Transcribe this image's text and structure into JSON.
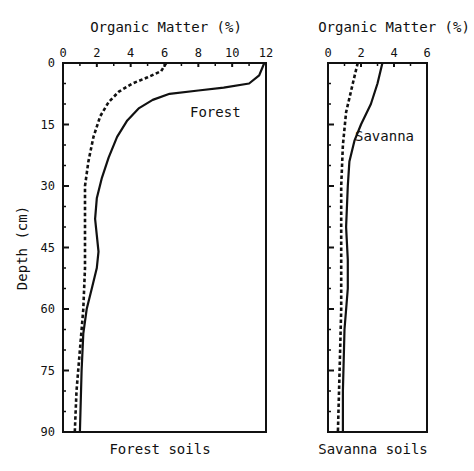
{
  "chart_data": [
    {
      "type": "line",
      "panel": "forest",
      "title": "Organic Matter (%)",
      "caption": "Forest soils",
      "xlabel": "Organic Matter (%)",
      "ylabel": "Depth (cm)",
      "xlim": [
        0,
        12
      ],
      "ylim": [
        0,
        90
      ],
      "y_inverted": true,
      "x_ticks": [
        0,
        2,
        4,
        6,
        8,
        10,
        12
      ],
      "y_ticks": [
        0,
        15,
        30,
        45,
        60,
        75,
        90
      ],
      "grid": false,
      "annotations": [
        {
          "text": "Forest",
          "x": 7.5,
          "y": 13
        }
      ],
      "series": [
        {
          "name": "Forest (solid)",
          "style": "solid",
          "points": [
            [
              11.9,
              0
            ],
            [
              11.6,
              3
            ],
            [
              11.0,
              5
            ],
            [
              9.5,
              6
            ],
            [
              8.0,
              6.7
            ],
            [
              6.3,
              7.5
            ],
            [
              5.3,
              9
            ],
            [
              4.5,
              11
            ],
            [
              3.8,
              14
            ],
            [
              3.2,
              18
            ],
            [
              2.7,
              23
            ],
            [
              2.3,
              28
            ],
            [
              2.0,
              33
            ],
            [
              1.9,
              38
            ],
            [
              2.0,
              42
            ],
            [
              2.1,
              46
            ],
            [
              2.0,
              50
            ],
            [
              1.7,
              55
            ],
            [
              1.4,
              60
            ],
            [
              1.2,
              66
            ],
            [
              1.1,
              75
            ],
            [
              1.0,
              90
            ]
          ]
        },
        {
          "name": "Forest comparison (dashed)",
          "style": "dashed",
          "points": [
            [
              6.1,
              0
            ],
            [
              5.8,
              2
            ],
            [
              5.0,
              3.5
            ],
            [
              4.1,
              5
            ],
            [
              3.3,
              7
            ],
            [
              2.7,
              9.5
            ],
            [
              2.2,
              13
            ],
            [
              1.8,
              18
            ],
            [
              1.5,
              24
            ],
            [
              1.3,
              30
            ],
            [
              1.3,
              40
            ],
            [
              1.3,
              50
            ],
            [
              1.2,
              60
            ],
            [
              1.0,
              70
            ],
            [
              0.8,
              80
            ],
            [
              0.7,
              90
            ]
          ]
        }
      ]
    },
    {
      "type": "line",
      "panel": "savanna",
      "title": "Organic Matter (%)",
      "caption": "Savanna soils",
      "xlabel": "Organic Matter (%)",
      "ylabel": "Depth (cm)",
      "xlim": [
        0,
        6
      ],
      "ylim": [
        0,
        90
      ],
      "y_inverted": true,
      "x_ticks": [
        0,
        2,
        4,
        6
      ],
      "y_ticks": [
        0,
        15,
        30,
        45,
        60,
        75,
        90
      ],
      "grid": false,
      "annotations": [
        {
          "text": "Savanna",
          "x": 2.8,
          "y": 18
        }
      ],
      "series": [
        {
          "name": "Savanna (solid)",
          "style": "solid",
          "points": [
            [
              3.3,
              0
            ],
            [
              3.0,
              5
            ],
            [
              2.6,
              10
            ],
            [
              2.0,
              15
            ],
            [
              1.6,
              19
            ],
            [
              1.3,
              24
            ],
            [
              1.2,
              30
            ],
            [
              1.1,
              40
            ],
            [
              1.2,
              48
            ],
            [
              1.2,
              55
            ],
            [
              1.0,
              65
            ],
            [
              0.9,
              80
            ],
            [
              0.9,
              90
            ]
          ]
        },
        {
          "name": "Savanna comparison (dashed)",
          "style": "dashed",
          "points": [
            [
              1.8,
              0
            ],
            [
              1.5,
              5
            ],
            [
              1.1,
              12
            ],
            [
              0.9,
              20
            ],
            [
              0.8,
              30
            ],
            [
              0.8,
              45
            ],
            [
              0.8,
              60
            ],
            [
              0.7,
              75
            ],
            [
              0.6,
              90
            ]
          ]
        }
      ]
    }
  ],
  "labels": {
    "forest_title": "Organic Matter (%)",
    "savanna_title": "Organic Matter (%)",
    "ylabel": "Depth (cm)",
    "forest_caption": "Forest soils",
    "savanna_caption": "Savanna soils",
    "forest_annotation": "Forest",
    "savanna_annotation": "Savanna"
  },
  "colors": {
    "ink": "#111111",
    "background": "#ffffff"
  }
}
